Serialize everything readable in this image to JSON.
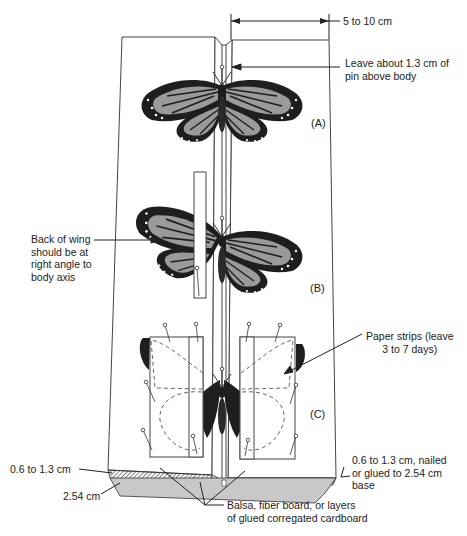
{
  "figure": {
    "dimension_top": "5 to 10 cm",
    "annotations": {
      "pin_height": [
        "Leave about 1.3 cm of",
        "pin above body"
      ],
      "wing_back": [
        "Back of wing",
        "should be at",
        "right angle to",
        "body axis"
      ],
      "paper_strips": [
        "Paper strips (leave",
        "3 to 7 days)"
      ],
      "top_board_thickness": "0.6 to 1.3 cm",
      "base_thickness": "2.54 cm",
      "right_board": [
        "0.6 to 1.3 cm, nailed",
        "or glued to 2.54 cm",
        "base"
      ],
      "material": [
        "Balsa, fiber board, or layers",
        "of glued corregated cardboard"
      ]
    },
    "stage_labels": {
      "a": "(A)",
      "b": "(B)",
      "c": "(C)"
    },
    "colors": {
      "ink": "#222222",
      "wing_fill": "#9a9a9a",
      "wing_dark": "#1e1e1e",
      "background": "#ffffff"
    }
  }
}
